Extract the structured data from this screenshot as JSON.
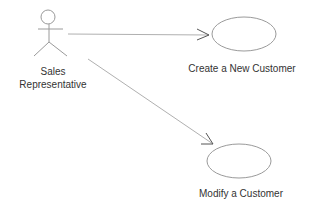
{
  "diagram": {
    "type": "UML use case diagram",
    "actor": {
      "name": "Sales Representative",
      "label_lines": [
        "Sales",
        "Representative"
      ]
    },
    "use_cases": [
      {
        "id": "uc1",
        "label": "Create a New Customer"
      },
      {
        "id": "uc2",
        "label": "Modify a Customer"
      }
    ],
    "associations": [
      {
        "from": "Sales Representative",
        "to": "Create a New Customer",
        "arrow": "open"
      },
      {
        "from": "Sales Representative",
        "to": "Modify a Customer",
        "arrow": "open"
      }
    ],
    "colors": {
      "stroke": "#9a9a9a",
      "text": "#333333",
      "background": "#ffffff"
    }
  }
}
